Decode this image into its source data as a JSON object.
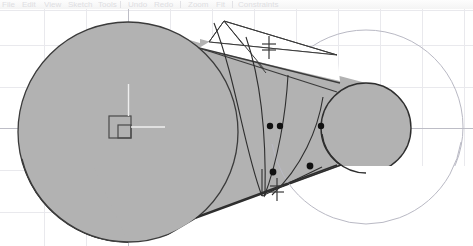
{
  "app": {
    "title": "CAD Sketch Viewport",
    "background": "#ffffff"
  },
  "toolbar": {
    "clipped": true,
    "items": [
      {
        "name": "menu-file",
        "label": "File",
        "x": 2
      },
      {
        "name": "menu-edit",
        "label": "Edit",
        "x": 22
      },
      {
        "name": "menu-view",
        "label": "View",
        "x": 44
      },
      {
        "name": "menu-sketch",
        "label": "Sketch",
        "x": 68
      },
      {
        "name": "menu-tools",
        "label": "Tools",
        "x": 98
      },
      {
        "name": "button-undo",
        "label": "Undo",
        "x": 128
      },
      {
        "name": "button-redo",
        "label": "Redo",
        "x": 154
      },
      {
        "name": "button-zoom",
        "label": "Zoom",
        "x": 188
      },
      {
        "name": "button-fit",
        "label": "Fit",
        "x": 216
      },
      {
        "name": "button-constraints",
        "label": "Constraints",
        "x": 238
      }
    ],
    "separators": [
      120,
      180,
      232
    ]
  },
  "viewport": {
    "name": "sketch-viewport",
    "grid": {
      "enabled": true,
      "spacing_px": 42,
      "minor_color": "#e9e9ed",
      "axis_color": "#b9b9c0",
      "vertical_lines": [
        44,
        86,
        128,
        170,
        212,
        254,
        296,
        338,
        380,
        422,
        464
      ],
      "horizontal_lines": [
        1,
        36,
        78,
        119,
        161,
        203
      ],
      "axis_x_y": 119,
      "axis_y_x": 128
    },
    "colors": {
      "fill": "#b2b2b2",
      "edge": "#3b3b3b",
      "construction": "#b9b9c4",
      "point": "#111111",
      "marker": "#4a4a4a"
    },
    "origin_marker": {
      "name": "origin-anchor",
      "x": 120,
      "y": 118,
      "size": 22,
      "inner_size": 9
    },
    "shapes": [
      {
        "name": "main-profile-body",
        "type": "filled-region",
        "note": "large circle fused with tapered cone to small right circle"
      },
      {
        "name": "large-circle",
        "type": "circle",
        "cx": 128,
        "cy": 123,
        "r": 110
      },
      {
        "name": "small-circle",
        "type": "circle",
        "cx": 366,
        "cy": 119,
        "r": 45
      },
      {
        "name": "construction-circle",
        "type": "circle",
        "cx": 366,
        "cy": 118,
        "r": 97
      },
      {
        "name": "upper-tangent-sliver",
        "type": "polygon"
      },
      {
        "name": "lower-arc-web",
        "type": "arc-group"
      }
    ],
    "points": [
      {
        "name": "sketch-point-1",
        "x": 270,
        "y": 117
      },
      {
        "name": "sketch-point-2",
        "x": 280,
        "y": 117
      },
      {
        "name": "sketch-point-3",
        "x": 321,
        "y": 117
      },
      {
        "name": "sketch-point-4",
        "x": 273,
        "y": 163
      },
      {
        "name": "sketch-point-5",
        "x": 310,
        "y": 157
      }
    ],
    "constraint_markers": [
      {
        "name": "equal-constraint-upper",
        "symbol": "equal",
        "x": 269,
        "y": 38
      },
      {
        "name": "equal-constraint-lower",
        "symbol": "equal",
        "x": 277,
        "y": 180
      }
    ]
  }
}
